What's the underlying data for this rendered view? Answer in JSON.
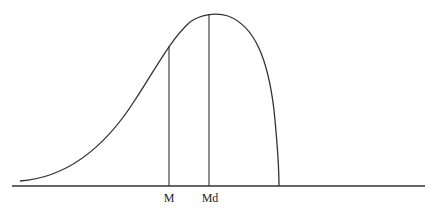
{
  "diagram": {
    "title": "",
    "labels": {
      "mean": "M",
      "median": "Md"
    },
    "colors": {
      "line": "#333333",
      "background": "#ffffff"
    }
  }
}
